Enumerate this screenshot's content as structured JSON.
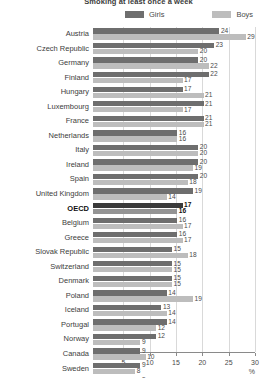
{
  "chart_data": {
    "type": "bar",
    "orientation": "horizontal",
    "title": "Smoking at least once a week",
    "xlabel": "%",
    "ylabel": "",
    "xlim": [
      0,
      30
    ],
    "xticks": [
      5,
      10,
      15,
      20,
      25,
      30
    ],
    "grid": true,
    "legend_position": "top",
    "categories": [
      "Austria",
      "Czech Republic",
      "Germany",
      "Finland",
      "Hungary",
      "Luxembourg",
      "France",
      "Netherlands",
      "Italy",
      "Ireland",
      "Spain",
      "United Kingdom",
      "OECD",
      "Belgium",
      "Greece",
      "Slovak Republic",
      "Switzerland",
      "Denmark",
      "Poland",
      "Iceland",
      "Portugal",
      "Norway",
      "Canada",
      "Sweden",
      "United States"
    ],
    "highlight_category": "OECD",
    "series": [
      {
        "name": "Girls",
        "color": "#6e6e6e",
        "values": [
          24,
          23,
          20,
          22,
          17,
          21,
          21,
          16,
          20,
          20,
          20,
          19,
          17,
          16,
          16,
          15,
          15,
          15,
          14,
          13,
          14,
          12,
          9,
          9,
          9
        ]
      },
      {
        "name": "Boys",
        "color": "#bdbdbd",
        "values": [
          29,
          20,
          22,
          17,
          21,
          17,
          21,
          16,
          20,
          19,
          18,
          14,
          16,
          17,
          17,
          18,
          15,
          15,
          19,
          14,
          12,
          9,
          10,
          8,
          7
        ]
      }
    ]
  }
}
